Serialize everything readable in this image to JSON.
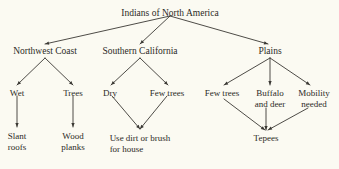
{
  "diagram": {
    "title": "Indians of North America",
    "type": "hierarchy-tree",
    "background_color": "#fbfaf2",
    "text_color": "#2b2a26",
    "edge_color": "#3a3833",
    "nodes": {
      "root": {
        "label": "Indians of North America",
        "x": 170,
        "y": 8
      },
      "northwest_coast": {
        "label": "Northwest Coast",
        "x": 45,
        "y": 46
      },
      "southern_california": {
        "label": "Southern California",
        "x": 140,
        "y": 46
      },
      "plains": {
        "label": "Plains",
        "x": 270,
        "y": 46
      },
      "wet": {
        "label": "Wet",
        "x": 17,
        "y": 88
      },
      "trees": {
        "label": "Trees",
        "x": 73,
        "y": 88
      },
      "dry": {
        "label": "Dry",
        "x": 110,
        "y": 88
      },
      "few_trees_sc": {
        "label": "Few trees",
        "x": 167,
        "y": 88
      },
      "few_trees_plains": {
        "label": "Few trees",
        "x": 222,
        "y": 88
      },
      "buffalo_and_deer": {
        "label": "Buffalo\nand deer",
        "x": 270,
        "y": 88
      },
      "mobility_needed": {
        "label": "Mobility\nneeded",
        "x": 314,
        "y": 88
      },
      "slant_roofs": {
        "label": "Slant\nroofs",
        "x": 17,
        "y": 131
      },
      "wood_planks": {
        "label": "Wood\nplanks",
        "x": 73,
        "y": 131
      },
      "use_dirt_or_brush_for_house": {
        "label": "Use dirt or brush\nfor house",
        "x": 140,
        "y": 133
      },
      "tepees": {
        "label": "Tepees",
        "x": 266,
        "y": 133
      }
    },
    "edges": [
      {
        "from": "root",
        "to": "northwest_coast",
        "points": "170,16 45,44"
      },
      {
        "from": "root",
        "to": "southern_california",
        "points": "170,16 140,44"
      },
      {
        "from": "root",
        "to": "plains",
        "points": "170,16 268,44"
      },
      {
        "from": "northwest_coast",
        "to": "wet",
        "points": "45,58 17,85"
      },
      {
        "from": "northwest_coast",
        "to": "trees",
        "points": "45,58 73,85"
      },
      {
        "from": "southern_california",
        "to": "dry",
        "points": "140,58 111,85"
      },
      {
        "from": "southern_california",
        "to": "few_trees_sc",
        "points": "140,58 168,85"
      },
      {
        "from": "plains",
        "to": "few_trees_plains",
        "points": "270,58 224,85"
      },
      {
        "from": "plains",
        "to": "buffalo_and_deer",
        "points": "270,58 270,85"
      },
      {
        "from": "plains",
        "to": "mobility_needed",
        "points": "270,58 310,85"
      },
      {
        "from": "wet",
        "to": "slant_roofs",
        "points": "17,96 17,127"
      },
      {
        "from": "trees",
        "to": "wood_planks",
        "points": "73,96 73,127"
      },
      {
        "from": "dry",
        "to": "use_dirt_or_brush_for_house",
        "points": "112,96 140,129"
      },
      {
        "from": "few_trees_sc",
        "to": "use_dirt_or_brush_for_house",
        "points": "167,96 140,129"
      },
      {
        "from": "few_trees_plains",
        "to": "tepees",
        "points": "224,99 265,130"
      },
      {
        "from": "buffalo_and_deer",
        "to": "tepees",
        "points": "266,108 266,130"
      },
      {
        "from": "mobility_needed",
        "to": "tepees",
        "points": "308,108 268,130"
      }
    ]
  }
}
